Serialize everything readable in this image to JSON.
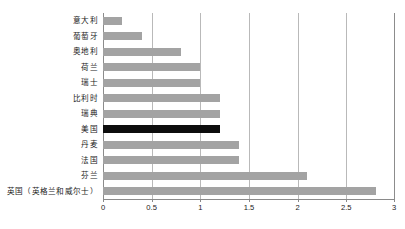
{
  "chart_data": {
    "type": "bar",
    "orientation": "horizontal",
    "title": "",
    "subtitle": "",
    "xlabel": "",
    "ylabel": "",
    "xlim": [
      0,
      3
    ],
    "grid": true,
    "legend": null,
    "xticks": [
      "0",
      "0.5",
      "1",
      "1.5",
      "2",
      "2.5",
      "3"
    ],
    "xtick_values": [
      0,
      0.5,
      1,
      1.5,
      2,
      2.5,
      3
    ],
    "categories": [
      "意大利",
      "葡萄牙",
      "奥地利",
      "荷兰",
      "瑞士",
      "比利时",
      "瑞典",
      "美国",
      "丹麦",
      "法国",
      "芬兰",
      "英国（英格兰和威尔士）"
    ],
    "values": [
      0.2,
      0.4,
      0.8,
      1.0,
      1.0,
      1.2,
      1.2,
      1.2,
      1.4,
      1.4,
      2.1,
      2.8
    ],
    "highlight_category": "美国",
    "highlight_index": 7,
    "colors": {
      "bar": "#a3a3a3",
      "highlight_bar": "#0d0d0d",
      "gridline": "#b9b9b9",
      "axis": "#8a8a8a",
      "text": "#1a1a1a",
      "background": "#ffffff"
    }
  }
}
